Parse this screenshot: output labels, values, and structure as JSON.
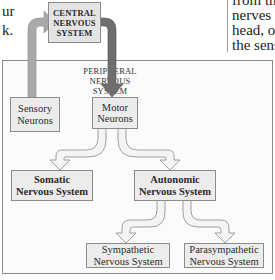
{
  "text_fragments": {
    "left": [
      "ur",
      "k."
    ],
    "right": [
      "from th",
      "nerves c",
      "head, or",
      "the sens"
    ]
  },
  "diagram": {
    "title_region": "Peripheral Nervous System",
    "nodes": {
      "cns": [
        "CENTRAL",
        "NERVOUS",
        "SYSTEM"
      ],
      "pns": [
        "PERIPHERAL",
        "NERVOUS",
        "SYSTEM"
      ],
      "sensory": [
        "Sensory",
        "Neurons"
      ],
      "motor": [
        "Motor",
        "Neurons"
      ],
      "somatic": [
        "Somatic",
        "Nervous System"
      ],
      "autonomic": [
        "Autonomic",
        "Nervous System"
      ],
      "sympathetic": [
        "Sympathetic",
        "Nervous System"
      ],
      "parasympathetic": [
        "Parasympathetic",
        "Nervous System"
      ]
    },
    "edges": [
      {
        "from": "Sensory Neurons",
        "to": "Central Nervous System",
        "style": "light-gray arrow"
      },
      {
        "from": "Central Nervous System",
        "to": "Motor Neurons",
        "style": "dark-gray arrow"
      },
      {
        "from": "Motor Neurons",
        "to": "Somatic Nervous System",
        "style": "outline arrow"
      },
      {
        "from": "Motor Neurons",
        "to": "Autonomic Nervous System",
        "style": "outline arrow"
      },
      {
        "from": "Autonomic Nervous System",
        "to": "Sympathetic Nervous System",
        "style": "outline arrow"
      },
      {
        "from": "Autonomic Nervous System",
        "to": "Parasympathetic Nervous System",
        "style": "outline arrow"
      }
    ],
    "colors": {
      "box_fill": "#ececec",
      "box_border": "#8c8c8c",
      "sensory_arrow": "#a9a9a9",
      "motor_arrow": "#6e6e6e",
      "outline_arrow_fill": "#f4f4f4"
    }
  }
}
